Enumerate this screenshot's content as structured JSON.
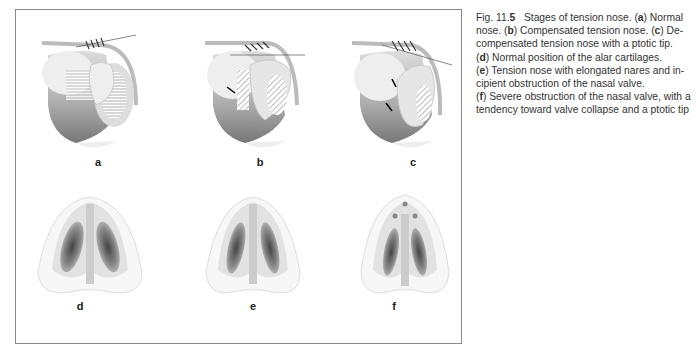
{
  "figure": {
    "panels": [
      {
        "id": "a",
        "label": "a",
        "view": "lateral",
        "description": "Normal nose"
      },
      {
        "id": "b",
        "label": "b",
        "view": "lateral",
        "description": "Compensated tension nose"
      },
      {
        "id": "c",
        "label": "c",
        "view": "lateral",
        "description": "Decompensated tension nose with a ptotic tip"
      },
      {
        "id": "d",
        "label": "d",
        "view": "basal",
        "description": "Normal position of the alar cartilages"
      },
      {
        "id": "e",
        "label": "e",
        "view": "basal",
        "description": "Tension nose with elongated nares and incipient obstruction of the nasal valve"
      },
      {
        "id": "f",
        "label": "f",
        "view": "basal",
        "description": "Severe obstruction of the nasal valve, with a tendency toward valve collapse and a ptotic tip"
      }
    ]
  },
  "caption": {
    "fig_prefix": "Fig. 11.",
    "fig_number": "5",
    "title": "Stages of tension nose.",
    "lines": [
      {
        "pre": "",
        "letter": "",
        "text": ""
      },
      {
        "letter": "b",
        "text": "Compensated tension nose. ("
      },
      {
        "letter": "c",
        "text": "De-"
      }
    ],
    "line1_tail_pre": " (",
    "line1_letter": "a",
    "line1_tail": ") Normal",
    "line2_pre": "nose. (",
    "line2_letter": "b",
    "line2_mid": ") Compensated tension nose. (",
    "line2_letter2": "c",
    "line2_tail": ") De-",
    "line3": "compensated tension nose with a ptotic tip.",
    "line4_pre": "(",
    "line4_letter": "d",
    "line4_tail": ") Normal position of the alar cartilages.",
    "line5_pre": "(",
    "line5_letter": "e",
    "line5_tail": ") Tension nose with elongated nares and in-",
    "line6": "cipient obstruction of the nasal valve.",
    "line7_pre": "(",
    "line7_letter": "f",
    "line7_tail": ") Severe obstruction of the nasal valve, with a",
    "line8": "tendency toward valve collapse and a ptotic tip"
  }
}
